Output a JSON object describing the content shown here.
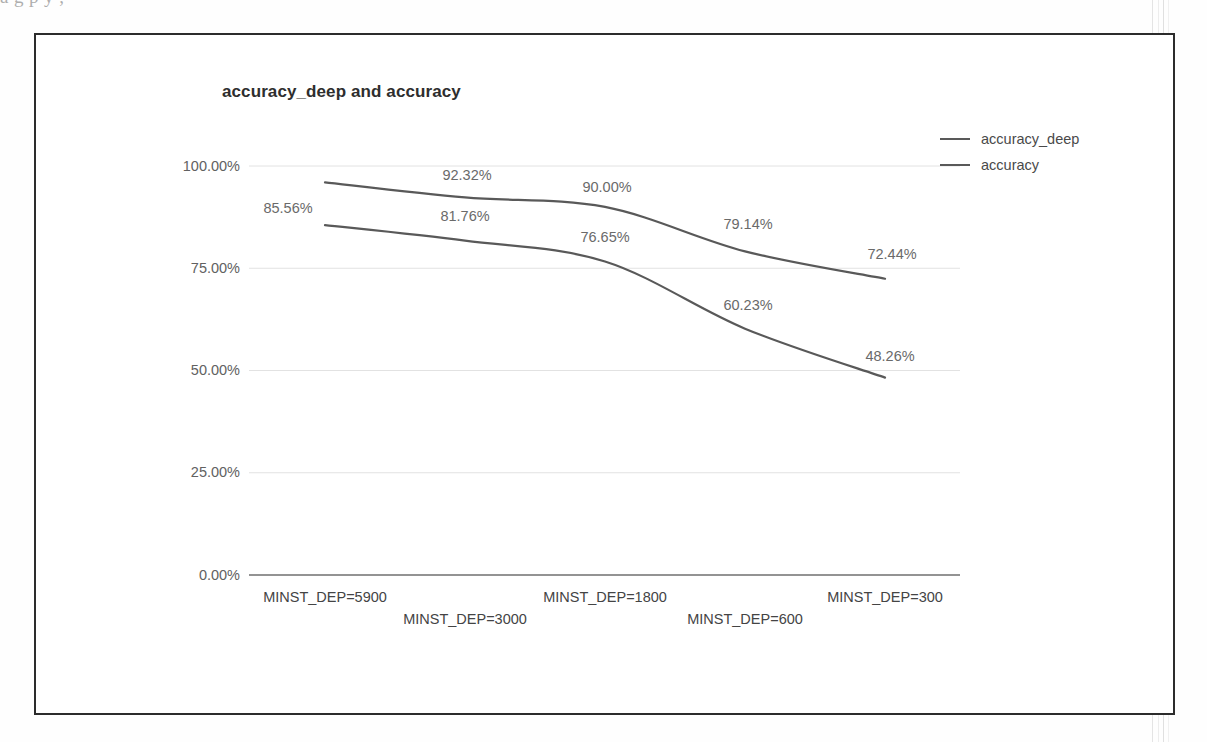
{
  "page": {
    "cutoff_text_above": "a  g                                               p       y                       ,"
  },
  "chart": {
    "title": "accuracy_deep and accuracy",
    "legend": {
      "position": "right",
      "items": [
        {
          "label": "accuracy_deep",
          "color": "#595959"
        },
        {
          "label": "accuracy",
          "color": "#595959"
        }
      ]
    }
  },
  "chart_data": {
    "type": "line",
    "title": "accuracy_deep and accuracy",
    "xlabel": "",
    "ylabel": "",
    "categories": [
      "MINST_DEP=5900",
      "MINST_DEP=3000",
      "MINST_DEP=1800",
      "MINST_DEP=600",
      "MINST_DEP=300"
    ],
    "series": [
      {
        "name": "accuracy_deep",
        "color": "#595959",
        "values": [
          96.0,
          92.32,
          90.0,
          79.14,
          72.44
        ],
        "value_labels": [
          "",
          "92.32%",
          "90.00%",
          "79.14%",
          "72.44%"
        ]
      },
      {
        "name": "accuracy",
        "color": "#595959",
        "values": [
          85.56,
          81.76,
          76.65,
          60.23,
          48.26
        ],
        "value_labels": [
          "85.56%",
          "81.76%",
          "76.65%",
          "60.23%",
          "48.26%"
        ]
      }
    ],
    "ylim": [
      0,
      100
    ],
    "ytick_values": [
      0,
      25,
      50,
      75,
      100
    ],
    "ytick_labels": [
      "0.00%",
      "25.00%",
      "50.00%",
      "75.00%",
      "100.00%"
    ],
    "grid": true,
    "grid_axis": "y",
    "legend_position": "right",
    "smoothing": true
  },
  "annotations": {
    "y_ticks": [
      {
        "label": "100.00%",
        "value": 100,
        "top": 158
      },
      {
        "label": "75.00%",
        "value": 75,
        "top": 260
      },
      {
        "label": "50.00%",
        "value": 50,
        "top": 362
      },
      {
        "label": "25.00%",
        "value": 25,
        "top": 464
      },
      {
        "label": "0.00%",
        "value": 0,
        "top": 567
      }
    ],
    "x_ticks": [
      {
        "label": "MINST_DEP=5900",
        "left": 325,
        "top": 589
      },
      {
        "label": "MINST_DEP=3000",
        "left": 465,
        "top": 611
      },
      {
        "label": "MINST_DEP=1800",
        "left": 605,
        "top": 589
      },
      {
        "label": "MINST_DEP=600",
        "left": 745,
        "top": 611
      },
      {
        "label": "MINST_DEP=300",
        "left": 885,
        "top": 589
      }
    ],
    "point_labels": [
      {
        "text": "85.56%",
        "left": 288,
        "top": 200
      },
      {
        "text": "92.32%",
        "left": 467,
        "top": 167
      },
      {
        "text": "81.76%",
        "left": 465,
        "top": 208
      },
      {
        "text": "90.00%",
        "left": 607,
        "top": 179
      },
      {
        "text": "76.65%",
        "left": 605,
        "top": 229
      },
      {
        "text": "79.14%",
        "left": 748,
        "top": 216
      },
      {
        "text": "60.23%",
        "left": 748,
        "top": 297
      },
      {
        "text": "72.44%",
        "left": 892,
        "top": 246
      },
      {
        "text": "48.26%",
        "left": 890,
        "top": 348
      }
    ]
  }
}
